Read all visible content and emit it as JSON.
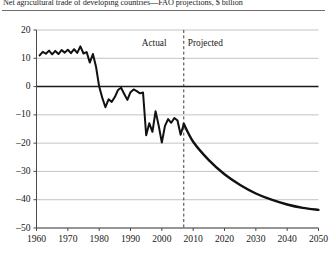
{
  "chart_data": {
    "type": "line",
    "title": "Net agricultural trade of developing countries—FAO projections, $ billion",
    "xlabel": "",
    "ylabel": "",
    "xlim": [
      1960,
      2050
    ],
    "ylim": [
      -50,
      20
    ],
    "grid": true,
    "legend": "none",
    "zero_line": true,
    "x_ticks": [
      "1960",
      "1970",
      "1980",
      "1990",
      "2000",
      "2010",
      "2020",
      "2030",
      "2040",
      "2050"
    ],
    "y_ticks": [
      "20",
      "10",
      "0",
      "-10",
      "-20",
      "-30",
      "-40",
      "-50"
    ],
    "annotations": [
      {
        "text": "Actual",
        "x": 2005,
        "y": 17,
        "align": "right"
      },
      {
        "text": "Projected",
        "x": 2009,
        "y": 17,
        "align": "left"
      }
    ],
    "divider": {
      "type": "vertical-dashed",
      "x": 2007,
      "label_left": "Actual",
      "label_right": "Projected"
    },
    "series": [
      {
        "name": "Net agricultural trade (actual)",
        "style": "solid",
        "segment": "actual",
        "x": [
          1961,
          1962,
          1963,
          1964,
          1965,
          1966,
          1967,
          1968,
          1969,
          1970,
          1971,
          1972,
          1973,
          1974,
          1975,
          1976,
          1977,
          1978,
          1979,
          1980,
          1981,
          1982,
          1983,
          1984,
          1985,
          1986,
          1987,
          1988,
          1989,
          1990,
          1991,
          1992,
          1993,
          1994,
          1995,
          1996,
          1997,
          1998,
          1999,
          2000,
          2001,
          2002,
          2003,
          2004,
          2005,
          2006,
          2007
        ],
        "values": [
          11.0,
          12.3,
          11.6,
          12.7,
          11.4,
          12.6,
          11.5,
          12.9,
          12.0,
          13.0,
          11.8,
          13.2,
          11.9,
          14.2,
          11.7,
          12.2,
          8.5,
          11.5,
          7.0,
          0.0,
          -4.0,
          -7.3,
          -4.5,
          -5.4,
          -3.7,
          -1.2,
          -0.4,
          -2.6,
          -4.7,
          -2.0,
          -1.0,
          -1.6,
          -2.4,
          -2.1,
          -17.2,
          -13.0,
          -16.0,
          -8.7,
          -13.8,
          -19.8,
          -13.9,
          -11.5,
          -12.8,
          -11.1,
          -12.0,
          -17.0,
          -13.2
        ]
      },
      {
        "name": "Net agricultural trade (projected)",
        "style": "solid",
        "segment": "projected",
        "x": [
          2007,
          2010,
          2015,
          2020,
          2025,
          2030,
          2035,
          2040,
          2045,
          2050
        ],
        "values": [
          -13.2,
          -19.5,
          -26.0,
          -31.0,
          -34.8,
          -37.8,
          -40.0,
          -41.7,
          -42.9,
          -43.6
        ]
      }
    ]
  }
}
